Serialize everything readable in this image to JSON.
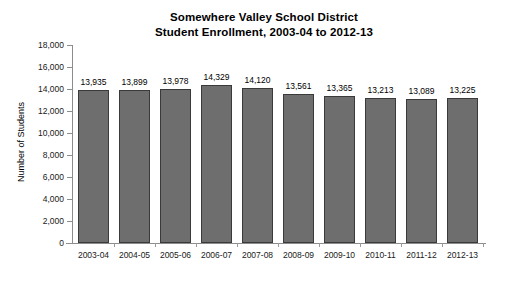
{
  "chart_data": {
    "type": "bar",
    "title": "Somewhere Valley School District Student Enrollment, 2003-04 to 2012-13",
    "title_line1": "Somewhere Valley School District",
    "title_line2": "Student Enrollment, 2003-04 to 2012-13",
    "xlabel": "",
    "ylabel": "Number of Students",
    "ylim": [
      0,
      18000
    ],
    "ytick_step": 2000,
    "ytick_labels": [
      "0",
      "2,000",
      "4,000",
      "6,000",
      "8,000",
      "10,000",
      "12,000",
      "14,000",
      "16,000",
      "18,000"
    ],
    "ytick_values": [
      0,
      2000,
      4000,
      6000,
      8000,
      10000,
      12000,
      14000,
      16000,
      18000
    ],
    "grid": false,
    "legend": false,
    "bar_color": "#6e6e6e",
    "bar_edge_color": "#3a3a3a",
    "axis_color": "#8d8d8d",
    "background": "#ffffff",
    "categories": [
      "2003-04",
      "2004-05",
      "2005-06",
      "2006-07",
      "2007-08",
      "2008-09",
      "2009-10",
      "2010-11",
      "2011-12",
      "2012-13"
    ],
    "values": [
      13935,
      13899,
      13978,
      14329,
      14120,
      13561,
      13365,
      13213,
      13089,
      13225
    ],
    "value_labels": [
      "13,935",
      "13,899",
      "13,978",
      "14,329",
      "14,120",
      "13,561",
      "13,365",
      "13,213",
      "13,089",
      "13,225"
    ]
  }
}
